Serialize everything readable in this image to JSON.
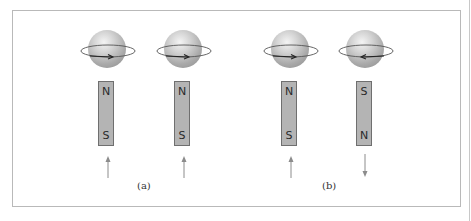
{
  "diagram": {
    "panels": [
      {
        "label": "(a)",
        "items": [
          {
            "spin_direction": "counterclockwise-front-right",
            "magnet": {
              "top": "N",
              "bottom": "S"
            },
            "arrow": "up"
          },
          {
            "spin_direction": "counterclockwise-front-right",
            "magnet": {
              "top": "N",
              "bottom": "S"
            },
            "arrow": "up"
          }
        ]
      },
      {
        "label": "(b)",
        "items": [
          {
            "spin_direction": "counterclockwise-front-right",
            "magnet": {
              "top": "N",
              "bottom": "S"
            },
            "arrow": "up"
          },
          {
            "spin_direction": "clockwise-front-left",
            "magnet": {
              "top": "S",
              "bottom": "N"
            },
            "arrow": "down"
          }
        ]
      }
    ],
    "colors": {
      "frame": "#b9b9b9",
      "magnet_fill": "#b4b4b4",
      "magnet_border": "#6f6f6f",
      "arrow": "#8c8c8c"
    }
  }
}
